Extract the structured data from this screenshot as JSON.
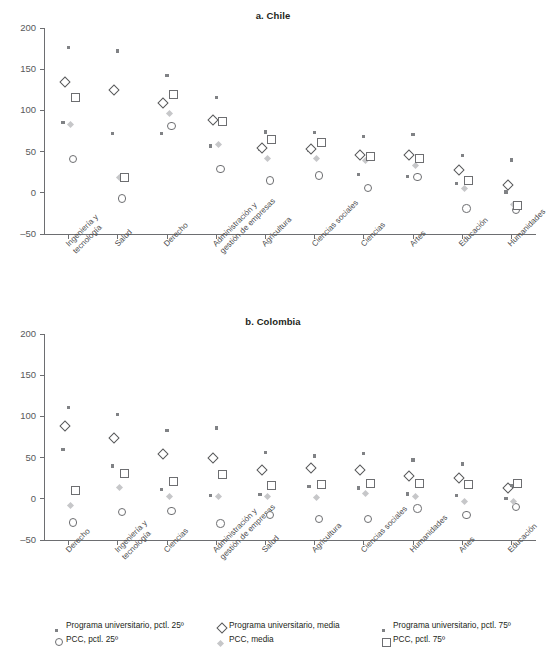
{
  "figure": {
    "clipped_header": "· ·",
    "background": "#ffffff",
    "text_color": "#231f20"
  },
  "colors": {
    "univ_pctl": "#808285",
    "univ_media_outline": "#58595b",
    "pcc_pctl25_outline": "#6d6e71",
    "pcc_media_fill": "#c6c7c9",
    "pcc_pctl75_outline": "#6d6e71",
    "axis": "#6d6e71",
    "tick_label": "#58595b"
  },
  "legend": {
    "items": [
      {
        "marker": "small-filled-square-icon",
        "label": "Programa universitario, pctl. 25º",
        "row": 0,
        "col": 0
      },
      {
        "marker": "open-diamond-icon",
        "label": "Programa universitario, media",
        "row": 0,
        "col": 1
      },
      {
        "marker": "small-filled-square-icon",
        "label": "Programa universitario, pctl. 75º",
        "row": 0,
        "col": 2
      },
      {
        "marker": "open-circle-icon",
        "label": "PCC, pctl. 25º",
        "row": 1,
        "col": 0
      },
      {
        "marker": "light-filled-diamond-icon",
        "label": "PCC, media",
        "row": 1,
        "col": 1
      },
      {
        "marker": "open-square-icon",
        "label": "PCC, pctl. 75º",
        "row": 1,
        "col": 2
      }
    ]
  },
  "chart_data": [
    {
      "id": "chile",
      "type": "scatter",
      "title": "a. Chile",
      "xlabel": "",
      "ylabel": "",
      "ylim": [
        -50,
        200
      ],
      "yticks": [
        -50,
        0,
        50,
        100,
        150,
        200
      ],
      "ytick_labels": [
        "–50",
        "0",
        "50",
        "100",
        "150",
        "200"
      ],
      "grid": false,
      "legend_position": "bottom",
      "categories": [
        "Ingeniería y\ntecnología",
        "Salud",
        "Derecho",
        "Administración y\ngestión de empresas",
        "Agricultura",
        "Ciencias sociales",
        "Ciencias",
        "Artes",
        "Educación",
        "Humanidades"
      ],
      "series": [
        {
          "name": "Programa universitario, pctl. 25º",
          "marker": "small-filled-square-icon",
          "values": [
            85,
            72,
            72,
            57,
            53,
            52,
            22,
            20,
            11,
            1
          ]
        },
        {
          "name": "Programa universitario, media",
          "marker": "open-diamond-icon",
          "values": [
            134,
            125,
            109,
            88,
            54,
            53,
            46,
            46,
            28,
            9
          ]
        },
        {
          "name": "Programa universitario, pctl. 75º",
          "marker": "small-filled-square-icon",
          "values": [
            176,
            172,
            142,
            116,
            74,
            73,
            68,
            71,
            45,
            40
          ]
        },
        {
          "name": "PCC, pctl. 25º",
          "marker": "open-circle-icon",
          "values": [
            41,
            -7,
            81,
            29,
            15,
            21,
            6,
            19,
            -19,
            -21
          ]
        },
        {
          "name": "PCC, media",
          "marker": "light-filled-diamond-icon",
          "values": [
            82,
            17,
            95,
            58,
            41,
            41,
            38,
            32,
            4,
            -16
          ]
        },
        {
          "name": "PCC, pctl. 75º",
          "marker": "open-square-icon",
          "values": [
            116,
            18,
            119,
            87,
            64,
            61,
            44,
            42,
            15,
            -15
          ]
        }
      ]
    },
    {
      "id": "colombia",
      "type": "scatter",
      "title": "b. Colombia",
      "xlabel": "",
      "ylabel": "",
      "ylim": [
        -50,
        200
      ],
      "yticks": [
        -50,
        0,
        50,
        100,
        150,
        200
      ],
      "ytick_labels": [
        "–50",
        "0",
        "50",
        "100",
        "150",
        "200"
      ],
      "grid": false,
      "legend_position": "bottom",
      "categories": [
        "Derecho",
        "Ingeniería y\ntecnología",
        "Ciencias",
        "Administración y\ngestión de empresas",
        "Salud",
        "Agricultura",
        "Ciencias sociales",
        "Humanidades",
        "Artes",
        "Educación"
      ],
      "series": [
        {
          "name": "Programa universitario, pctl. 25º",
          "marker": "small-filled-square-icon",
          "values": [
            60,
            40,
            11,
            4,
            5,
            15,
            13,
            6,
            4,
            0
          ]
        },
        {
          "name": "Programa universitario, media",
          "marker": "open-diamond-icon",
          "values": [
            88,
            74,
            54,
            49,
            35,
            37,
            35,
            28,
            25,
            13
          ]
        },
        {
          "name": "Programa universitario, pctl. 75º",
          "marker": "small-filled-square-icon",
          "values": [
            111,
            102,
            83,
            86,
            56,
            52,
            55,
            47,
            42,
            16
          ]
        },
        {
          "name": "PCC, pctl. 25º",
          "marker": "open-circle-icon",
          "values": [
            -29,
            -16,
            -15,
            -30,
            -20,
            -25,
            -25,
            -12,
            -20,
            -10
          ]
        },
        {
          "name": "PCC, media",
          "marker": "light-filled-diamond-icon",
          "values": [
            -9,
            12,
            1,
            1,
            1,
            0,
            5,
            2,
            -4,
            -5
          ]
        },
        {
          "name": "PCC, pctl. 75º",
          "marker": "open-square-icon",
          "values": [
            10,
            30,
            21,
            29,
            16,
            17,
            19,
            19,
            17,
            18
          ]
        }
      ]
    }
  ]
}
